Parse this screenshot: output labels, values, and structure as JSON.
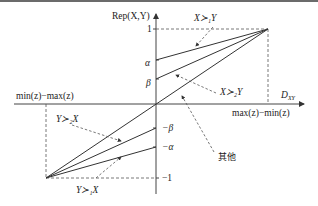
{
  "diagram": {
    "y_axis_label": "Rep(X,Y)",
    "x_axis_label_right": "D",
    "x_axis_label_right_sub": "XY",
    "x_pos_label": "max(z)−min(z)",
    "x_neg_label": "min(z)−max(z)",
    "y_ticks": {
      "one": "1",
      "alpha": "α",
      "beta": "β",
      "neg_beta": "−β",
      "neg_alpha": "−α",
      "neg_one": "−1"
    },
    "annotations": {
      "x_pref1_y": "X≻₁Y",
      "x_pref2_y": "X≻₂Y",
      "y_pref2_x": "Y≻₂X",
      "y_pref1_x": "Y≻₁X",
      "other": "其他"
    },
    "line_color": "#333333"
  }
}
